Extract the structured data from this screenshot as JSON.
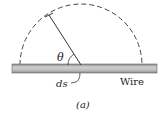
{
  "diagram": {
    "angle_label": "θ",
    "element_label": "ds",
    "wire_label": "Wire",
    "caption": "(a)",
    "colors": {
      "wire_fill": "#b9b9b9",
      "wire_edge": "#6e6e6e",
      "line": "#333333",
      "dashed_arc": "#444444"
    }
  }
}
